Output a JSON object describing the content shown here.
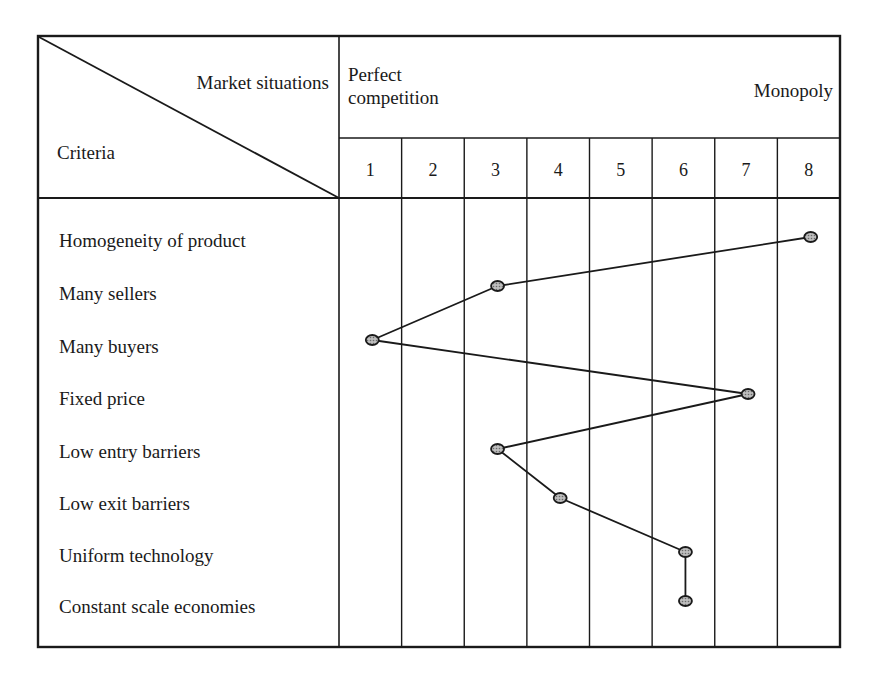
{
  "table": {
    "corner_top_label": "Market situations",
    "corner_bottom_label": "Criteria",
    "spectrum_left_label_line1": "Perfect",
    "spectrum_left_label_line2": "competition",
    "spectrum_right_label": "Monopoly",
    "columns": [
      "1",
      "2",
      "3",
      "4",
      "5",
      "6",
      "7",
      "8"
    ],
    "criteria": [
      "Homogeneity of product",
      "Many sellers",
      "Many buyers",
      "Fixed price",
      "Low entry barriers",
      "Low exit barriers",
      "Uniform technology",
      "Constant scale economies"
    ]
  },
  "chart_data": {
    "type": "line",
    "title": "",
    "xlabel": "Market situations (1 = Perfect competition … 8 = Monopoly)",
    "ylabel": "Criteria",
    "x_categories": [
      "1",
      "2",
      "3",
      "4",
      "5",
      "6",
      "7",
      "8"
    ],
    "x_range_labels": {
      "left": "Perfect competition",
      "right": "Monopoly"
    },
    "categories": [
      "Homogeneity of product",
      "Many sellers",
      "Many buyers",
      "Fixed price",
      "Low entry barriers",
      "Low exit barriers",
      "Uniform technology",
      "Constant scale economies"
    ],
    "values": [
      8,
      3,
      1,
      7,
      3,
      4,
      6,
      6
    ],
    "orientation": "horizontal-profile",
    "grid": true,
    "legend": null
  },
  "colors": {
    "ink": "#1a1a1a",
    "marker_fill": "#9a9a9a",
    "background": "#ffffff"
  }
}
